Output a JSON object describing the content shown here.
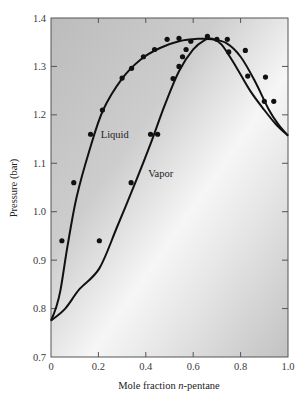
{
  "chart_data": {
    "type": "line",
    "title": "",
    "xlabel_parts": [
      "Mole fraction ",
      "n",
      "-pentane"
    ],
    "xlabel": "Mole fraction n-pentane",
    "ylabel": "Pressure (bar)",
    "xlim": [
      0,
      1.0
    ],
    "ylim": [
      0.7,
      1.4
    ],
    "xticks": [
      0,
      0.2,
      0.4,
      0.6,
      0.8,
      1.0
    ],
    "xtick_labels": [
      "0",
      "0.2",
      "0.4",
      "0.6",
      "0.8",
      "1.0"
    ],
    "yticks": [
      0.7,
      0.8,
      0.9,
      1.0,
      1.1,
      1.2,
      1.3,
      1.4
    ],
    "ytick_labels": [
      "0.7",
      "0.8",
      "0.9",
      "1.0",
      "1.1",
      "1.2",
      "1.3",
      "1.4"
    ],
    "grid": false,
    "legend": "none (inline curve labels)",
    "annotations": [
      {
        "text": "Liquid",
        "x": 0.21,
        "y": 1.16
      },
      {
        "text": "Vapor",
        "x": 0.41,
        "y": 1.08
      }
    ],
    "series": [
      {
        "name": "Liquid",
        "kind": "curve",
        "x": [
          0.0,
          0.02,
          0.04,
          0.07,
          0.108,
          0.163,
          0.22,
          0.3,
          0.38,
          0.46,
          0.54,
          0.62,
          0.68,
          0.74,
          0.8,
          0.86,
          0.92,
          0.96,
          1.0
        ],
        "y": [
          0.775,
          0.8,
          0.838,
          0.93,
          1.03,
          1.128,
          1.21,
          1.275,
          1.315,
          1.338,
          1.352,
          1.357,
          1.356,
          1.348,
          1.32,
          1.27,
          1.21,
          1.18,
          1.157
        ]
      },
      {
        "name": "Vapor",
        "kind": "curve",
        "x": [
          0.0,
          0.06,
          0.12,
          0.204,
          0.28,
          0.36,
          0.42,
          0.48,
          0.54,
          0.6,
          0.65,
          0.68,
          0.72,
          0.78,
          0.84,
          0.9,
          0.95,
          1.0
        ],
        "y": [
          0.775,
          0.8,
          0.84,
          0.883,
          0.97,
          1.065,
          1.14,
          1.22,
          1.29,
          1.335,
          1.355,
          1.357,
          1.345,
          1.3,
          1.25,
          1.21,
          1.18,
          1.157
        ]
      },
      {
        "name": "Experimental points",
        "kind": "scatter",
        "x": [
          0.046,
          0.204,
          0.096,
          0.338,
          0.167,
          0.42,
          0.45,
          0.217,
          0.3,
          0.34,
          0.39,
          0.437,
          0.49,
          0.515,
          0.54,
          0.555,
          0.57,
          0.54,
          0.59,
          0.66,
          0.7,
          0.744,
          0.75,
          0.82,
          0.83,
          0.905,
          0.9,
          0.94
        ],
        "y": [
          0.94,
          0.94,
          1.06,
          1.06,
          1.16,
          1.16,
          1.16,
          1.21,
          1.276,
          1.296,
          1.32,
          1.335,
          1.356,
          1.275,
          1.3,
          1.32,
          1.335,
          1.358,
          1.352,
          1.362,
          1.356,
          1.356,
          1.33,
          1.333,
          1.28,
          1.278,
          1.228,
          1.228
        ]
      }
    ]
  },
  "colors": {
    "plot_bg_dark": "#bdbdbd",
    "plot_bg_light": "#f4f4f4",
    "line": "#111111",
    "axis": "#4a4a4a",
    "text": "#2a2a2a"
  }
}
